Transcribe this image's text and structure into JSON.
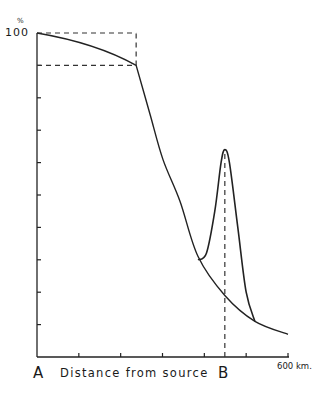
{
  "chart_data": {
    "type": "line",
    "title": "",
    "xlabel": "Distance from source",
    "ylabel": "%",
    "x_unit": "km",
    "xlim": [
      0,
      600
    ],
    "ylim": [
      0,
      100
    ],
    "x_ticks_interval_km": 100,
    "y_ticks_interval_pct": 10,
    "tick_labels": {
      "y_top": "100",
      "y_unit": "%",
      "x_end": "600 km."
    },
    "point_labels": [
      {
        "label": "A",
        "x": 0
      },
      {
        "label": "B",
        "x": 450
      }
    ],
    "grid": false,
    "series": [
      {
        "name": "main decay curve",
        "style": "solid",
        "x": [
          0,
          237,
          270,
          301,
          342,
          385,
          449,
          521,
          600
        ],
        "y": [
          100,
          90,
          75,
          61,
          48,
          31,
          19,
          11,
          7
        ]
      },
      {
        "name": "secondary peak at B",
        "style": "solid",
        "x": [
          385,
          405,
          425,
          440,
          449,
          460,
          480,
          500,
          521
        ],
        "y": [
          30,
          32,
          45,
          60,
          64,
          60,
          40,
          20,
          11
        ]
      }
    ],
    "reference_lines": [
      {
        "type": "horizontal-dashed",
        "y": 100,
        "x_range": [
          0,
          237
        ]
      },
      {
        "type": "horizontal-dashed",
        "y": 90,
        "x_range": [
          0,
          237
        ]
      },
      {
        "type": "vertical-dashed",
        "x": 237,
        "y_range": [
          90,
          100
        ]
      },
      {
        "type": "vertical-dashed",
        "x": 449,
        "y_range": [
          0,
          64
        ]
      }
    ]
  },
  "labels": {
    "y_unit": "%",
    "y_top": "100",
    "point_a": "A",
    "x_axis_title": "Distance from source",
    "point_b": "B",
    "x_end": "600 km."
  }
}
